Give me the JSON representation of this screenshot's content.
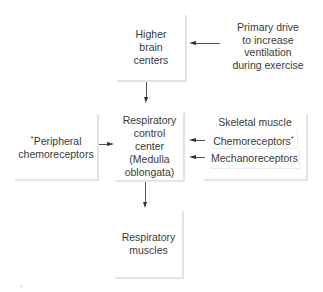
{
  "diagram": {
    "nodes": {
      "higher_brain": {
        "lines": [
          "Higher",
          "brain",
          "centers"
        ]
      },
      "primary_drive": {
        "lines": [
          "Primary drive",
          "to increase",
          "ventilation",
          "during exercise"
        ]
      },
      "peripheral": {
        "asterisk": "*",
        "lines": [
          "Peripheral",
          "chemoreceptors"
        ]
      },
      "control_center": {
        "lines": [
          "Respiratory",
          "control",
          "center",
          "(Medulla",
          "oblongata)"
        ]
      },
      "skeletal_muscle": {
        "title": "Skeletal muscle",
        "chemoreceptors": "Chemoreceptors",
        "chemoreceptors_asterisk": "*",
        "mechanoreceptors": "Mechanoreceptors"
      },
      "resp_muscles": {
        "lines": [
          "Respiratory",
          "muscles"
        ]
      }
    },
    "edges": [
      {
        "from": "primary_drive",
        "to": "higher_brain"
      },
      {
        "from": "higher_brain",
        "to": "control_center"
      },
      {
        "from": "peripheral",
        "to": "control_center"
      },
      {
        "from": "skeletal_muscle.chemoreceptors",
        "to": "control_center"
      },
      {
        "from": "skeletal_muscle.mechanoreceptors",
        "to": "control_center"
      },
      {
        "from": "control_center",
        "to": "resp_muscles"
      }
    ],
    "footnote_mark": "*"
  }
}
